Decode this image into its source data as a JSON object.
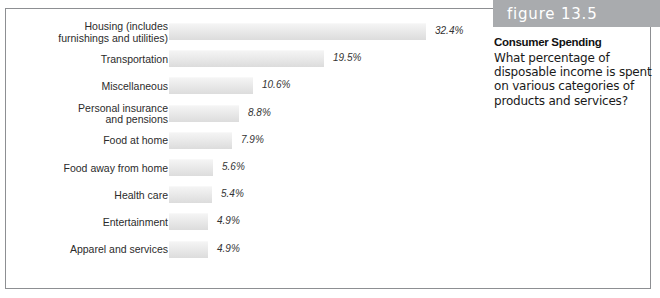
{
  "figure": {
    "number_label": "figure 13.5",
    "title": "Consumer Spending",
    "body": "What percentage of disposable income is spent on various categories of products and services?",
    "band_color": "#a9abae",
    "bar_color": "#eaeaea",
    "frame_color": "#8d8f92"
  },
  "chart_data": {
    "type": "bar",
    "orientation": "horizontal",
    "title": "Consumer Spending",
    "xlabel": "",
    "ylabel": "",
    "xlim": [
      0,
      32.4
    ],
    "grid": false,
    "legend": null,
    "value_suffix": "%",
    "categories": [
      "Housing (includes furnishings and utilities)",
      "Transportation",
      "Miscellaneous",
      "Personal insurance and pensions",
      "Food at home",
      "Food away from home",
      "Health care",
      "Entertainment",
      "Apparel and services"
    ],
    "values": [
      32.4,
      19.5,
      10.6,
      8.8,
      7.9,
      5.6,
      5.4,
      4.9,
      4.9
    ],
    "value_labels": [
      "32.4%",
      "19.5%",
      "10.6%",
      "8.8%",
      "7.9%",
      "5.6%",
      "5.4%",
      "4.9%",
      "4.9%"
    ],
    "category_labels": [
      "Housing (includes\nfurnishings and utilities)",
      "Transportation",
      "Miscellaneous",
      "Personal insurance\nand pensions",
      "Food at home",
      "Food away from home",
      "Health care",
      "Entertainment",
      "Apparel and services"
    ]
  }
}
